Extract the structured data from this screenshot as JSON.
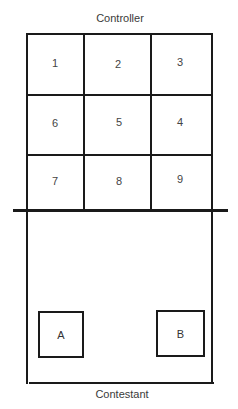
{
  "diagram": {
    "top_label": "Controller",
    "bottom_label": "Contestant",
    "grid": {
      "rows": [
        [
          "1",
          "2",
          "3"
        ],
        [
          "6",
          "5",
          "4"
        ],
        [
          "7",
          "8",
          "9"
        ]
      ]
    },
    "boxes": [
      {
        "label": "A"
      },
      {
        "label": "B"
      }
    ],
    "colors": {
      "line": "#1a1a1a",
      "text": "#333333",
      "background": "#ffffff"
    }
  }
}
